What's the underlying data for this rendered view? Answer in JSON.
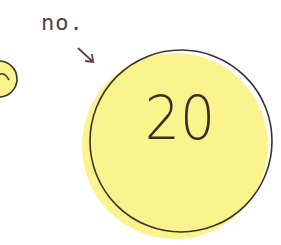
{
  "label": {
    "text": "no."
  },
  "badge": {
    "number": "20"
  },
  "colors": {
    "fill": "#fbf48c",
    "outline": "#3a3230",
    "text": "#3a2f25",
    "label_text": "#4a4347",
    "arrow": "#5a4245"
  },
  "icons": {
    "arrow": "arrow-down-right-icon",
    "side_circle": "partial-smiley-icon"
  }
}
